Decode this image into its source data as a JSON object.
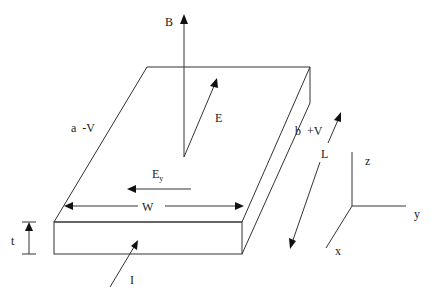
{
  "diagram": {
    "labels": {
      "magnetic_field": "B",
      "electric_field": "E",
      "hall_field_main": "E",
      "hall_field_sub": "y",
      "side_a": "a  -V",
      "side_b": "b  +V",
      "width": "W",
      "length": "L",
      "thickness": "t",
      "current": "I"
    },
    "axes": {
      "z": "z",
      "y": "y",
      "x": "x"
    }
  }
}
